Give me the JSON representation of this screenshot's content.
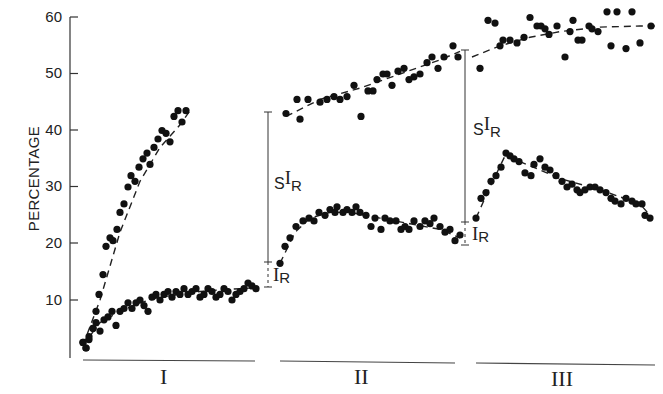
{
  "chart_data": {
    "type": "scatter",
    "title": "",
    "xlabel": "",
    "ylabel": "PERCENTAGE",
    "ylim": [
      0,
      60
    ],
    "yticks": [
      10,
      20,
      30,
      40,
      50,
      60
    ],
    "grid": false,
    "legend": "none",
    "segments": [
      "I",
      "II",
      "III"
    ],
    "annotations": [
      {
        "segment": "I",
        "labels": [
          "SIR",
          "IR"
        ],
        "sir_range": [
          17,
          43
        ],
        "ir_range": [
          12.5,
          17
        ]
      },
      {
        "segment": "II",
        "labels": [
          "SIR",
          "IR"
        ],
        "sir_range": [
          24,
          54
        ],
        "ir_range": [
          20,
          24
        ]
      }
    ],
    "series": [
      {
        "name": "Upper (SIR) segment I",
        "segment": "I",
        "x": [
          83,
          86,
          89,
          93,
          96,
          99,
          103,
          106,
          110,
          113,
          117,
          120,
          124,
          128,
          131,
          135,
          139,
          143,
          147,
          150,
          154,
          158,
          162,
          166,
          170,
          174,
          178,
          182,
          186
        ],
        "y": [
          2.5,
          1.5,
          3,
          5,
          8,
          11,
          14.5,
          19.5,
          21,
          20.5,
          22.5,
          25.5,
          27,
          30,
          32,
          31,
          33.5,
          35,
          36,
          34,
          37,
          38.5,
          40,
          39.5,
          38,
          42.5,
          43.5,
          41.5,
          43.5
        ]
      },
      {
        "name": "Lower (IR) segment I",
        "segment": "I",
        "x": [
          83,
          86,
          89,
          93,
          96,
          100,
          104,
          108,
          112,
          116,
          120,
          124,
          128,
          132,
          136,
          140,
          144,
          148,
          152,
          156,
          160,
          164,
          168,
          172,
          176,
          180,
          184,
          188,
          192,
          196,
          200,
          204,
          208,
          212,
          216,
          220,
          224,
          228,
          232,
          236,
          240,
          244,
          248,
          252,
          256
        ],
        "y": [
          2.5,
          1.5,
          3.5,
          5,
          6,
          4.5,
          6.5,
          7,
          8,
          5.5,
          8,
          8.5,
          9.5,
          8.5,
          9.5,
          10,
          9,
          8,
          10.5,
          11,
          10,
          11,
          11.5,
          10.5,
          11.5,
          11,
          12,
          11,
          11.5,
          12,
          10.5,
          11,
          12,
          11.5,
          10.5,
          11,
          12,
          11.5,
          10,
          11,
          11.5,
          12,
          13,
          12.5,
          12
        ]
      },
      {
        "name": "Upper (SIR) segment II",
        "segment": "II",
        "x": [
          286,
          297,
          300,
          308,
          320,
          327,
          334,
          340,
          347,
          354,
          361,
          368,
          373,
          377,
          383,
          387,
          392,
          398,
          404,
          409,
          414,
          420,
          427,
          432,
          438,
          444,
          453,
          458
        ],
        "y": [
          43,
          45.5,
          42,
          45.5,
          45,
          45.5,
          46,
          45.5,
          46,
          48,
          42.5,
          47,
          47,
          49,
          50,
          50,
          48,
          50.5,
          51,
          49,
          49.5,
          50,
          52,
          53,
          51,
          53,
          55,
          53
        ]
      },
      {
        "name": "Lower (IR) segment II",
        "segment": "II",
        "x": [
          280,
          285,
          290,
          296,
          303,
          309,
          314,
          319,
          325,
          330,
          335,
          337,
          343,
          347,
          352,
          356,
          360,
          366,
          371,
          375,
          381,
          385,
          390,
          396,
          401,
          405,
          409,
          414,
          420,
          425,
          430,
          434,
          440,
          445,
          450,
          455,
          460
        ],
        "y": [
          16.5,
          19.5,
          21,
          23,
          24,
          24.5,
          24,
          25.5,
          25,
          26,
          25.5,
          26.5,
          25.5,
          26,
          25.5,
          26.5,
          25.5,
          25,
          23,
          24.5,
          22.5,
          24.5,
          24,
          24,
          22.5,
          23,
          22.5,
          24,
          23,
          24,
          23.5,
          24.5,
          23,
          22,
          22.5,
          20.5,
          21.5
        ]
      },
      {
        "name": "Upper (SIR) segment III",
        "segment": "III",
        "x": [
          480,
          488,
          495,
          500,
          503,
          510,
          517,
          524,
          530,
          537,
          541,
          545,
          549,
          557,
          565,
          570,
          573,
          578,
          582,
          589,
          592,
          598,
          607,
          611,
          617,
          626,
          632,
          640,
          651
        ],
        "y": [
          51,
          59.5,
          59,
          55,
          56,
          56,
          55.5,
          56.5,
          60,
          58.5,
          58.5,
          58,
          57,
          58.5,
          53,
          57.5,
          59.5,
          56,
          56,
          58.5,
          58,
          57.5,
          61,
          55,
          61,
          54.5,
          61,
          55.5,
          58.5
        ]
      },
      {
        "name": "Lower (IR) segment III",
        "segment": "III",
        "x": [
          476,
          481,
          486,
          491,
          496,
          501,
          506,
          510,
          514,
          519,
          525,
          531,
          534,
          540,
          545,
          550,
          556,
          562,
          567,
          572,
          577,
          580,
          585,
          590,
          595,
          600,
          606,
          611,
          615,
          621,
          626,
          632,
          636,
          642,
          645,
          650
        ],
        "y": [
          24.5,
          28,
          29,
          31,
          32,
          33.5,
          36,
          35.5,
          35,
          34.5,
          32.5,
          32,
          34,
          35,
          33.5,
          33,
          32,
          31,
          30,
          30.5,
          29.5,
          29,
          29.5,
          30,
          30,
          29.5,
          29,
          28,
          27.5,
          27,
          28,
          27.5,
          27,
          27,
          25,
          24.5
        ]
      }
    ],
    "fit_curves": [
      {
        "name": "fit upper I",
        "x": [
          83,
          100,
          120,
          140,
          160,
          180,
          190
        ],
        "y": [
          2,
          10,
          22,
          31,
          37,
          41,
          43.5
        ]
      },
      {
        "name": "fit lower I",
        "x": [
          83,
          100,
          120,
          140,
          160,
          180,
          200,
          220,
          240,
          258
        ],
        "y": [
          2,
          6,
          8,
          9.5,
          10.5,
          11,
          11.5,
          11.8,
          12,
          12.2
        ]
      },
      {
        "name": "fit upper II",
        "x": [
          286,
          320,
          360,
          400,
          440,
          460
        ],
        "y": [
          42.5,
          45.5,
          47.5,
          50,
          52.5,
          54
        ]
      },
      {
        "name": "fit lower II",
        "x": [
          280,
          295,
          310,
          330,
          350,
          380,
          410,
          440,
          460
        ],
        "y": [
          16.5,
          22,
          24.5,
          25.5,
          25.5,
          24.5,
          23.5,
          22.5,
          21
        ]
      },
      {
        "name": "fit upper III",
        "x": [
          472,
          500,
          530,
          560,
          600,
          640,
          655
        ],
        "y": [
          53,
          55,
          56.5,
          57.5,
          58.3,
          58.5,
          58.5
        ]
      },
      {
        "name": "fit lower III",
        "x": [
          476,
          490,
          505,
          520,
          560,
          600,
          640,
          650
        ],
        "y": [
          24.5,
          30,
          35.5,
          34.5,
          31.5,
          29.5,
          27,
          25
        ]
      }
    ]
  },
  "axis": {
    "ylabel": "PERCENTAGE",
    "ticks": [
      "60",
      "50",
      "40",
      "30",
      "20",
      "10"
    ]
  },
  "segments": {
    "I": "I",
    "II": "II",
    "III": "III"
  },
  "annotations": {
    "a1": {
      "s": "S",
      "i": "I",
      "r": "R",
      "ir_i": "I",
      "ir_r": "R"
    },
    "a2": {
      "s": "S",
      "i": "I",
      "r": "R",
      "ir_i": "I",
      "ir_r": "R"
    }
  }
}
